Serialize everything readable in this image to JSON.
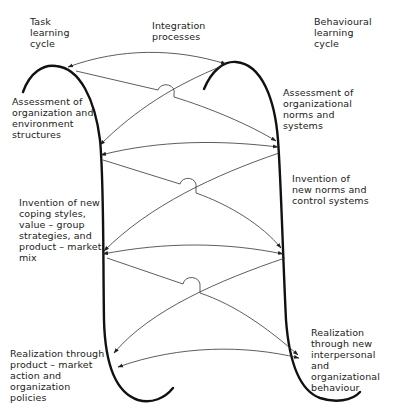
{
  "headers": {
    "task_cycle": "Task\nlearning\ncycle",
    "integration": "Integration\nprocesses",
    "behavioural_cycle": "Behavioural\nlearning\ncycle"
  },
  "task_cycle_stages": [
    {
      "label": "Assessment of\norganization and\nenvironment\nstructures"
    },
    {
      "label": "Invention of new\ncoping styles,\nvalue – group\nstrategies, and\nproduct – market\nmix"
    },
    {
      "label": "Realization through\nproduct – market\naction and\norganization\npolicies"
    }
  ],
  "behavioural_cycle_stages": [
    {
      "label": "Assessment of\norganizational\nnorms and\nsystems"
    },
    {
      "label": "Invention of\nnew norms and\ncontrol systems"
    },
    {
      "label": "Realization\nthrough new\ninterpersonal\nand organizational\nbehaviour"
    }
  ],
  "colors": {
    "cycle_stroke": "#111111",
    "arrow_stroke": "#333333",
    "background": "#ffffff"
  }
}
